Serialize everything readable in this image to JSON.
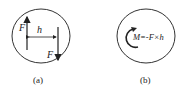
{
  "figure_a": {
    "caption": "(a)",
    "force_left_label": "F",
    "force_right_label": "F",
    "distance_label": "h"
  },
  "figure_b": {
    "caption": "(b)",
    "moment_label": "M=-F×h"
  }
}
